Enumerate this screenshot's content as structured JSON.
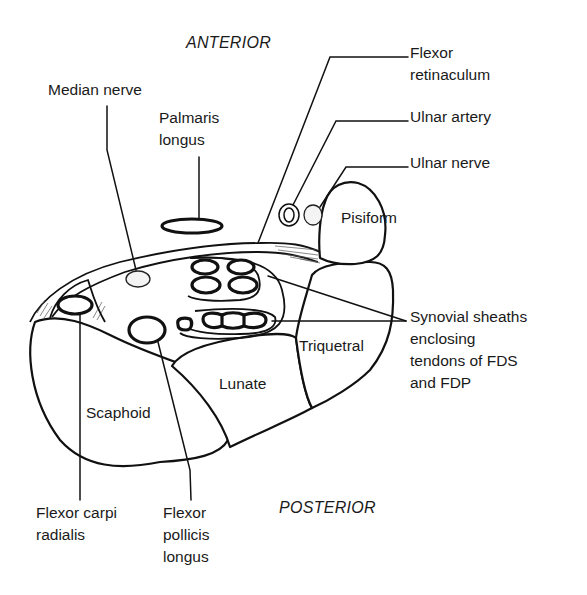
{
  "diagram": {
    "orientation": {
      "top": "ANTERIOR",
      "bottom": "POSTERIOR"
    },
    "labels": {
      "median_nerve": "Median nerve",
      "palmaris_longus": "Palmaris\nlongus",
      "flexor_retinaculum": "Flexor\nretinaculum",
      "ulnar_artery": "Ulnar artery",
      "ulnar_nerve": "Ulnar nerve",
      "pisiform": "Pisiform",
      "synovial_sheaths": "Synovial sheaths\nenclosing\ntendons of FDS\nand FDP",
      "triquetral": "Triquetral",
      "lunate": "Lunate",
      "scaphoid": "Scaphoid",
      "flexor_carpi_radialis": "Flexor carpi\nradialis",
      "flexor_pollicis_longus": "Flexor\npollicis\nlongus"
    },
    "colors": {
      "ink": "#111111",
      "background": "#ffffff"
    }
  }
}
